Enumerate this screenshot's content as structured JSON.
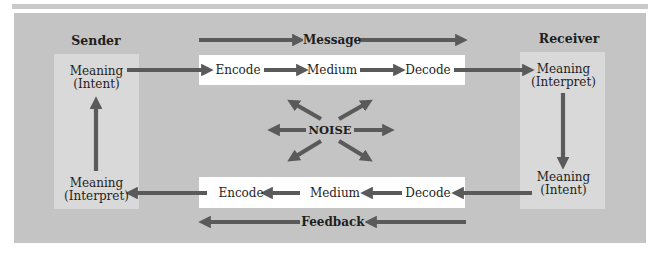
{
  "diagram": {
    "title_sender": "Sender",
    "title_receiver": "Receiver",
    "message_label": "Message",
    "feedback_label": "Feedback",
    "noise_label": "NOISE",
    "sender": {
      "top_line1": "Meaning",
      "top_line2": "(Intent)",
      "bottom_line1": "Meaning",
      "bottom_line2": "(Interpret)"
    },
    "receiver": {
      "top_line1": "Meaning",
      "top_line2": "(Interpret)",
      "bottom_line1": "Meaning",
      "bottom_line2": "(Intent)"
    },
    "forward_chain": [
      "Encode",
      "Medium",
      "Decode"
    ],
    "feedback_chain": [
      "Encode",
      "Medium",
      "Decode"
    ],
    "colors": {
      "panel": "#c4c4c4",
      "side_box": "#d9d9d9",
      "strip": "#ffffff",
      "arrow": "#5a5a5a",
      "text": "#1e1e1e"
    }
  }
}
